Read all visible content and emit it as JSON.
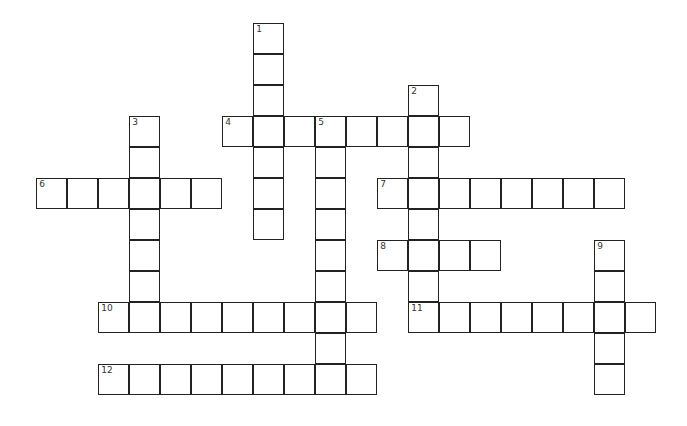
{
  "puzzle": {
    "type": "crossword",
    "cell_size": 31,
    "origin": {
      "x": 37,
      "y": 24
    },
    "entries": [
      {
        "number": "1",
        "direction": "down",
        "row": 0,
        "col": 7,
        "length": 7
      },
      {
        "number": "2",
        "direction": "down",
        "row": 2,
        "col": 12,
        "length": 8
      },
      {
        "number": "3",
        "direction": "down",
        "row": 3,
        "col": 3,
        "length": 7
      },
      {
        "number": "4",
        "direction": "across",
        "row": 3,
        "col": 6,
        "length": 8
      },
      {
        "number": "5",
        "direction": "down",
        "row": 3,
        "col": 9,
        "length": 9
      },
      {
        "number": "6",
        "direction": "across",
        "row": 5,
        "col": 0,
        "length": 6
      },
      {
        "number": "7",
        "direction": "across",
        "row": 5,
        "col": 11,
        "length": 8
      },
      {
        "number": "8",
        "direction": "across",
        "row": 7,
        "col": 11,
        "length": 4
      },
      {
        "number": "9",
        "direction": "down",
        "row": 7,
        "col": 18,
        "length": 5
      },
      {
        "number": "10",
        "direction": "across",
        "row": 9,
        "col": 2,
        "length": 9
      },
      {
        "number": "11",
        "direction": "across",
        "row": 9,
        "col": 12,
        "length": 8
      },
      {
        "number": "12",
        "direction": "across",
        "row": 11,
        "col": 2,
        "length": 9
      }
    ]
  }
}
